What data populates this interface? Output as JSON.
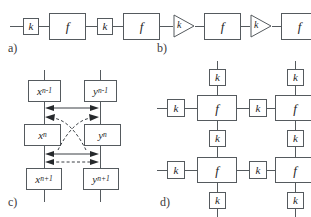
{
  "figure": {
    "background_color": "#ffffff",
    "line_color": "#555a5e",
    "text_color": "#1f1f1f"
  },
  "symbols": {
    "gain": "k",
    "map": "f"
  },
  "panels": {
    "a": {
      "label": "a)",
      "description": "open chain of gain blocks and map blocks",
      "blocks": [
        {
          "type": "k",
          "text": "k"
        },
        {
          "type": "f",
          "text": "f"
        },
        {
          "type": "k",
          "text": "k"
        },
        {
          "type": "f",
          "text": "f"
        }
      ]
    },
    "b": {
      "label": "b)",
      "description": "open chain of triangular amplifiers and map blocks",
      "blocks": [
        {
          "type": "amp",
          "text": "k"
        },
        {
          "type": "f",
          "text": "f"
        },
        {
          "type": "amp",
          "text": "k"
        },
        {
          "type": "f",
          "text": "f"
        }
      ]
    },
    "c": {
      "label": "c)",
      "description": "two coupled state chains x and y with solid intra-level and dashed cross-level couplings",
      "columns": [
        {
          "name": "x",
          "nodes": [
            {
              "base": "x",
              "sub": "n-1"
            },
            {
              "base": "x",
              "sub": "n"
            },
            {
              "base": "x",
              "sub": "n+1"
            }
          ]
        },
        {
          "name": "y",
          "nodes": [
            {
              "base": "y",
              "sub": "n-1"
            },
            {
              "base": "y",
              "sub": "n"
            },
            {
              "base": "y",
              "sub": "n+1"
            }
          ]
        }
      ],
      "couplings": [
        {
          "style": "solid",
          "kind": "bidirectional-horizontal",
          "level": "upper"
        },
        {
          "style": "dashed",
          "kind": "crossed-diagonal",
          "level": "upper-to-lower"
        },
        {
          "style": "solid",
          "kind": "bidirectional-horizontal",
          "level": "lower"
        },
        {
          "style": "dashed",
          "kind": "bidirectional-horizontal",
          "level": "lower"
        }
      ]
    },
    "d": {
      "label": "d)",
      "description": "two-by-two lattice of map blocks coupled through gain blocks on every edge",
      "cells": [
        {
          "row": 0,
          "col": 0,
          "center": {
            "type": "f",
            "text": "f"
          },
          "neighbors": {
            "top": {
              "type": "k",
              "text": "k"
            },
            "left": {
              "type": "k",
              "text": "k"
            },
            "right": {
              "type": "k",
              "text": "k"
            },
            "bottom": {
              "type": "k",
              "text": "k"
            }
          }
        },
        {
          "row": 0,
          "col": 1,
          "center": {
            "type": "f",
            "text": "f"
          },
          "neighbors": {
            "top": {
              "type": "k",
              "text": "k"
            },
            "right": {
              "type": "k",
              "text": "k"
            },
            "bottom": {
              "type": "k",
              "text": "k"
            }
          }
        },
        {
          "row": 1,
          "col": 0,
          "center": {
            "type": "f",
            "text": "f"
          },
          "neighbors": {
            "left": {
              "type": "k",
              "text": "k"
            },
            "right": {
              "type": "k",
              "text": "k"
            },
            "bottom": {
              "type": "k",
              "text": "k"
            }
          }
        },
        {
          "row": 1,
          "col": 1,
          "center": {
            "type": "f",
            "text": "f"
          },
          "neighbors": {
            "right": {
              "type": "k",
              "text": "k"
            },
            "bottom": {
              "type": "k",
              "text": "k"
            }
          }
        }
      ]
    }
  }
}
